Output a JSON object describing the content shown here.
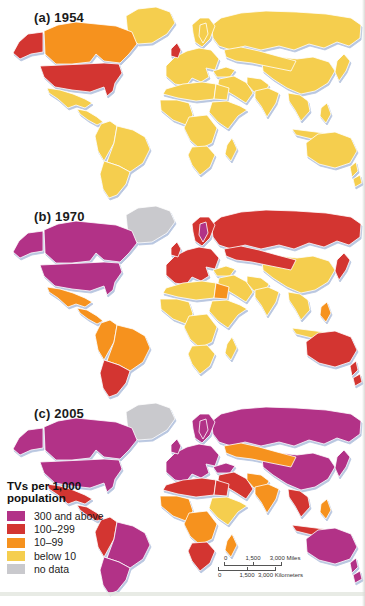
{
  "figure": {
    "panels": [
      {
        "label": "(a) 1954",
        "regions": {
          "greenland": "below10",
          "canada": "10-99",
          "alaska": "100-299",
          "usa": "100-299",
          "mexico": "below10",
          "central-america": "below10",
          "sa-west": "below10",
          "sa-east": "below10",
          "sa-south": "below10",
          "russia": "below10",
          "europe": "below10",
          "uk": "100-299",
          "scandinavia": "below10",
          "sweden": "below10",
          "china": "below10",
          "central-asia": "below10",
          "turkey": "below10",
          "middle-east": "below10",
          "iran-pak": "below10",
          "india": "below10",
          "se-asia": "below10",
          "indonesia": "below10",
          "philippines": "below10",
          "japan": "below10",
          "africa-north": "below10",
          "egypt": "below10",
          "africa-west": "below10",
          "africa-east": "below10",
          "africa-central": "below10",
          "africa-south": "below10",
          "madagascar": "below10",
          "australia": "below10",
          "new-zealand": "below10"
        }
      },
      {
        "label": "(b) 1970",
        "regions": {
          "greenland": "nodata",
          "canada": "300+",
          "alaska": "300+",
          "usa": "300+",
          "mexico": "10-99",
          "central-america": "10-99",
          "sa-west": "10-99",
          "sa-east": "10-99",
          "sa-south": "100-299",
          "russia": "100-299",
          "europe": "100-299",
          "uk": "100-299",
          "scandinavia": "100-299",
          "sweden": "300+",
          "china": "below10",
          "central-asia": "100-299",
          "turkey": "below10",
          "middle-east": "below10",
          "iran-pak": "below10",
          "india": "below10",
          "se-asia": "below10",
          "indonesia": "below10",
          "philippines": "10-99",
          "japan": "100-299",
          "africa-north": "below10",
          "egypt": "10-99",
          "africa-west": "below10",
          "africa-east": "below10",
          "africa-central": "below10",
          "africa-south": "below10",
          "madagascar": "below10",
          "australia": "100-299",
          "new-zealand": "100-299"
        }
      },
      {
        "label": "(c) 2005",
        "regions": {
          "greenland": "nodata",
          "canada": "300+",
          "alaska": "300+",
          "usa": "300+",
          "mexico": "100-299",
          "central-america": "100-299",
          "sa-west": "100-299",
          "sa-east": "300+",
          "sa-south": "300+",
          "russia": "300+",
          "europe": "300+",
          "uk": "300+",
          "scandinavia": "300+",
          "sweden": "300+",
          "china": "300+",
          "central-asia": "10-99",
          "turkey": "300+",
          "middle-east": "100-299",
          "iran-pak": "10-99",
          "india": "10-99",
          "se-asia": "100-299",
          "indonesia": "100-299",
          "philippines": "10-99",
          "japan": "300+",
          "africa-north": "100-299",
          "egypt": "100-299",
          "africa-west": "10-99",
          "africa-east": "below10",
          "africa-central": "10-99",
          "africa-south": "100-299",
          "madagascar": "10-99",
          "australia": "300+",
          "new-zealand": "300+"
        }
      }
    ],
    "legend": {
      "title_line1": "TVs per 1,000",
      "title_line2": "population",
      "items": [
        {
          "key": "300+",
          "label": "300 and above",
          "color": "#B23287"
        },
        {
          "key": "100-299",
          "label": "100–299",
          "color": "#D33531"
        },
        {
          "key": "10-99",
          "label": "10–99",
          "color": "#F6921E"
        },
        {
          "key": "below10",
          "label": "below 10",
          "color": "#F5CE4E"
        },
        {
          "key": "nodata",
          "label": "no data",
          "color": "#C9C9CD"
        }
      ]
    },
    "scalebar": {
      "miles": [
        "0",
        "1,500",
        "3,000 Miles"
      ],
      "kilometers": [
        "0",
        "1,500",
        "3,000 Kilometers"
      ]
    }
  }
}
